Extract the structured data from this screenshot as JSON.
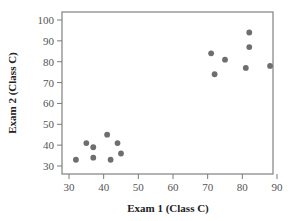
{
  "chart_data": {
    "type": "scatter",
    "title": "",
    "xlabel": "Exam 1 (Class C)",
    "ylabel": "Exam 2 (Class C)",
    "xlim": [
      28,
      92
    ],
    "ylim": [
      27,
      104
    ],
    "xticks": [
      30,
      40,
      50,
      60,
      70,
      80,
      90
    ],
    "yticks": [
      30,
      40,
      50,
      60,
      70,
      80,
      90,
      100
    ],
    "grid": false,
    "legend": null,
    "series": [
      {
        "name": "Class C",
        "color": "#6e6e6e",
        "points": [
          {
            "x": 32,
            "y": 33
          },
          {
            "x": 35,
            "y": 41
          },
          {
            "x": 37,
            "y": 39
          },
          {
            "x": 37,
            "y": 34
          },
          {
            "x": 41,
            "y": 45
          },
          {
            "x": 42,
            "y": 33
          },
          {
            "x": 44,
            "y": 41
          },
          {
            "x": 45,
            "y": 36
          },
          {
            "x": 71,
            "y": 84
          },
          {
            "x": 72,
            "y": 74
          },
          {
            "x": 75,
            "y": 81
          },
          {
            "x": 81,
            "y": 77
          },
          {
            "x": 82,
            "y": 94
          },
          {
            "x": 82,
            "y": 87
          },
          {
            "x": 88,
            "y": 78
          }
        ]
      }
    ]
  },
  "colors": {
    "axis": "#7a7a7a",
    "frame": "#8a8a8a",
    "point": "#6e6e6e"
  }
}
